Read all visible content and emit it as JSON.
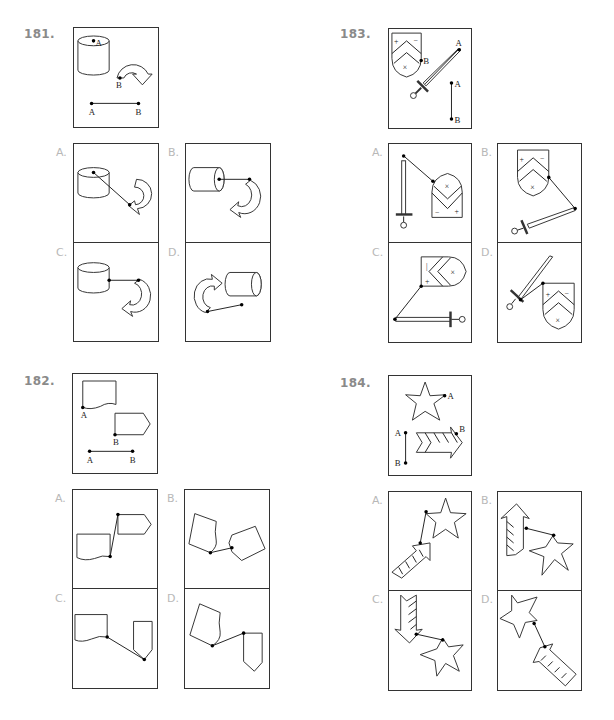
{
  "page": {
    "questions": [
      {
        "number": "181.",
        "example_labels": [
          "A",
          "B",
          "A",
          "B"
        ],
        "options": [
          {
            "label": "A."
          },
          {
            "label": "B."
          },
          {
            "label": "C."
          },
          {
            "label": "D."
          }
        ]
      },
      {
        "number": "182.",
        "example_labels": [
          "A",
          "B",
          "A",
          "B"
        ],
        "options": [
          {
            "label": "A."
          },
          {
            "label": "B."
          },
          {
            "label": "C."
          },
          {
            "label": "D."
          }
        ]
      },
      {
        "number": "183.",
        "example_labels": [
          "A",
          "B",
          "A",
          "B"
        ],
        "options": [
          {
            "label": "A."
          },
          {
            "label": "B."
          },
          {
            "label": "C."
          },
          {
            "label": "D."
          }
        ]
      },
      {
        "number": "184.",
        "example_labels": [
          "A",
          "B",
          "A",
          "B"
        ],
        "options": [
          {
            "label": "A."
          },
          {
            "label": "B."
          },
          {
            "label": "C."
          },
          {
            "label": "D."
          }
        ]
      }
    ],
    "colors": {
      "question_number": "#8a8a8a",
      "option_label": "#b8b8b8",
      "line": "#222222"
    }
  }
}
